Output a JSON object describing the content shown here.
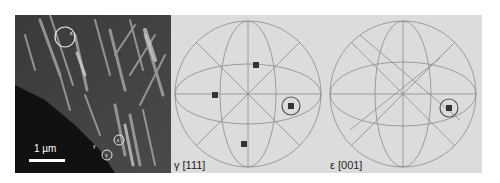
{
  "figure": {
    "micrograph": {
      "scale_bar_label": "1 µm",
      "markers": [
        {
          "label": "ε",
          "x": 50,
          "y": 12
        },
        {
          "label": "ε",
          "x": 104,
          "y": 129
        },
        {
          "label": "γ",
          "x": 104,
          "y": 141
        },
        {
          "label": "γ",
          "x": 92,
          "y": 137
        }
      ]
    },
    "stereograms": [
      {
        "phase": "gamma",
        "label": "γ [111]",
        "poles": [
          {
            "x": 256,
            "y": 65,
            "circled": false
          },
          {
            "x": 215,
            "y": 95,
            "circled": false
          },
          {
            "x": 291,
            "y": 106,
            "circled": true
          },
          {
            "x": 244,
            "y": 144,
            "circled": false
          }
        ]
      },
      {
        "phase": "epsilon",
        "label": "ε [001]",
        "poles": [
          {
            "x": 449,
            "y": 108,
            "circled": true
          }
        ]
      }
    ],
    "colors": {
      "panel_bg": "#dcdcdc",
      "grid_line": "#8a8a8a",
      "pole": "#333333",
      "circle": "#555555",
      "micrograph_bg": "#2b2b2b"
    }
  }
}
